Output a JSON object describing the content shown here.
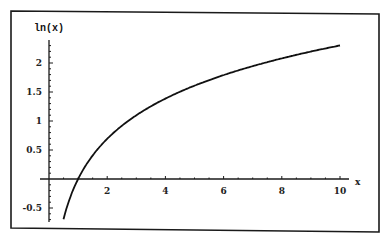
{
  "chart_data": {
    "type": "line",
    "title": "",
    "xlabel": "x",
    "ylabel": "ln(x)",
    "function": "ln(x)",
    "xlim": [
      0,
      10
    ],
    "ylim": [
      -0.7,
      2.3
    ],
    "x_ticks": [
      2,
      4,
      6,
      8,
      10
    ],
    "x_tick_labels": [
      "2",
      "4",
      "6",
      "8",
      "10"
    ],
    "y_ticks": [
      -0.5,
      0.5,
      1,
      1.5,
      2
    ],
    "y_tick_labels": [
      "-0.5",
      "0.5",
      "1",
      "1.5",
      "2"
    ],
    "grid": false,
    "legend": null,
    "series": [
      {
        "name": "ln(x)",
        "x": [
          0.5,
          0.75,
          1,
          1.25,
          1.5,
          2,
          2.5,
          3,
          3.5,
          4,
          5,
          6,
          7,
          8,
          9,
          10
        ],
        "y": [
          -0.69,
          -0.29,
          0,
          0.22,
          0.41,
          0.69,
          0.92,
          1.1,
          1.25,
          1.39,
          1.61,
          1.79,
          1.95,
          2.08,
          2.2,
          2.3
        ]
      }
    ]
  },
  "colors": {
    "line": "#111111",
    "frame": "#1a1a1a",
    "background": "#ffffff"
  }
}
